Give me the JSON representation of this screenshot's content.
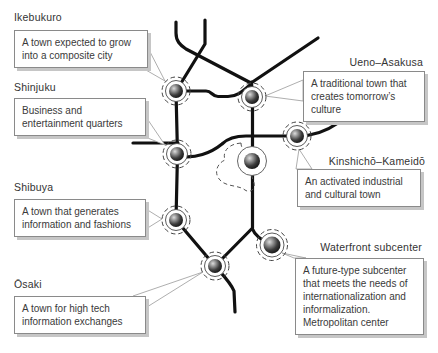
{
  "diagram_type": "tokyo-subcenters-network-diagram",
  "colors": {
    "background": "#ffffff",
    "rail_line": "#111111",
    "box_border": "#8a8a8a",
    "box_shadow": "#c6c6c6",
    "text": "#3a3a3a",
    "pointer_border": "#999999",
    "node_dashed_ring": "#444444"
  },
  "callouts": [
    {
      "label": "Ikebukuro",
      "lines": [
        "A town expected to grow",
        "into a composite city"
      ]
    },
    {
      "label": "Shinjuku",
      "lines": [
        "Business and",
        "entertainment quarters"
      ]
    },
    {
      "label": "Shibuya",
      "lines": [
        "A town that generates",
        "information and fashions"
      ]
    },
    {
      "label": "Ōsaki",
      "lines": [
        "A town for high tech",
        "information exchanges"
      ]
    },
    {
      "label": "Ueno–Asakusa",
      "lines": [
        "A traditional town that",
        "creates tomorrow’s",
        "culture"
      ]
    },
    {
      "label": "Kinshichō–Kameidō",
      "lines": [
        "An activated industrial",
        "and cultural town"
      ]
    },
    {
      "label": "Waterfront subcenter",
      "lines": [
        "A future-type subcenter",
        "that meets the needs of",
        "internationalization and",
        "informalization.",
        "Metropolitan center"
      ]
    }
  ]
}
